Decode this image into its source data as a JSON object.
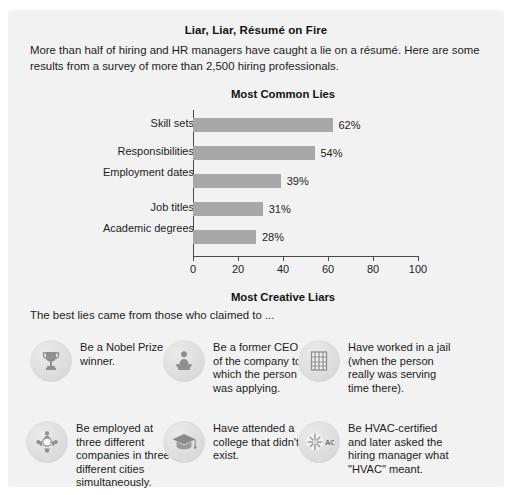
{
  "header": {
    "title": "Liar, Liar, Résumé on Fire",
    "intro": "More than half of hiring and HR managers have caught a lie on a résumé. Here are some results from a survey of more than 2,500 hiring professionals."
  },
  "chart_data": {
    "type": "bar",
    "orientation": "horizontal",
    "title": "Most Common Lies",
    "categories": [
      "Skill sets",
      "Responsibilities",
      "Employment dates",
      "Job titles",
      "Academic degrees"
    ],
    "values": [
      62,
      54,
      39,
      31,
      28
    ],
    "value_labels": [
      "62%",
      "54%",
      "39%",
      "31%",
      "28%"
    ],
    "xlabel": "",
    "ylabel": "",
    "xlim": [
      0,
      100
    ],
    "xticks": [
      0,
      20,
      40,
      60,
      80,
      100
    ],
    "xtick_labels": [
      "0",
      "20",
      "40",
      "60",
      "80",
      "100"
    ],
    "grid": false,
    "legend": false,
    "bar_color": "#a8a8a8",
    "axis_color": "#4a4a4a"
  },
  "creative": {
    "title": "Most Creative Liars",
    "subtitle": "The best lies came from those who claimed to ...",
    "items": [
      {
        "icon": "trophy-icon",
        "text": "Be a Nobel Prize winner."
      },
      {
        "icon": "podium-speaker-icon",
        "text": "Be a former CEO of the company to which the person was applying."
      },
      {
        "icon": "jail-window-icon",
        "text": "Have worked in a jail (when the person really was serving time there)."
      },
      {
        "icon": "multi-worker-icon",
        "text": "Be employed at three different companies in three different cities simultaneously."
      },
      {
        "icon": "graduation-cap-icon",
        "text": "Have attended a college that didn't exist."
      },
      {
        "icon": "air-conditioner-icon",
        "text": "Be HVAC-certified and later asked the hiring manager what \"HVAC\" meant."
      }
    ]
  },
  "colors": {
    "card_background": "#f2f2f2",
    "page_background": "#ffffff",
    "text": "#1c1c1c",
    "bar": "#a8a8a8",
    "medal": "#dcdcdc"
  }
}
